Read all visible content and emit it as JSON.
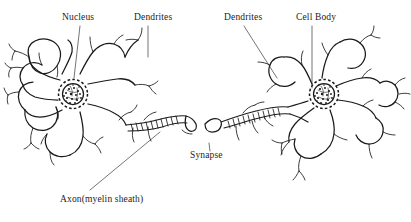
{
  "figure": {
    "background_color": "#ffffff",
    "ink_color": "#1a1a1a",
    "width": 411,
    "height": 222
  },
  "labels": {
    "nucleus": "Nucleus",
    "dendrites_left": "Dendrites",
    "dendrites_right": "Dendrites",
    "cell_body": "Cell Body",
    "synapse": "Synapse",
    "axon": "Axon(myelin sheath)"
  },
  "structures": [
    {
      "name": "left-neuron-soma",
      "label": "Cell body (left neuron)"
    },
    {
      "name": "left-neuron-nucleus",
      "label": "Nucleus"
    },
    {
      "name": "left-neuron-dendrites",
      "label": "Dendrites"
    },
    {
      "name": "left-neuron-axon",
      "label": "Axon with myelin sheath"
    },
    {
      "name": "synapse-gap",
      "label": "Synapse"
    },
    {
      "name": "right-neuron-axon",
      "label": "Axon with myelin sheath"
    },
    {
      "name": "right-neuron-soma",
      "label": "Cell body (right neuron)"
    },
    {
      "name": "right-neuron-nucleus",
      "label": "Nucleus"
    },
    {
      "name": "right-neuron-dendrites",
      "label": "Dendrites"
    }
  ],
  "leader_lines": [
    {
      "name": "leader-nucleus",
      "from": "Nucleus label",
      "to": "left neuron nucleus"
    },
    {
      "name": "leader-dendrites-left",
      "from": "Dendrites label",
      "to": "left neuron dendrite"
    },
    {
      "name": "leader-dendrites-right",
      "from": "Dendrites label",
      "to": "right neuron dendrite"
    },
    {
      "name": "leader-cell-body",
      "from": "Cell Body label",
      "to": "right neuron soma"
    },
    {
      "name": "leader-synapse",
      "from": "Synapse label",
      "to": "synaptic gap"
    },
    {
      "name": "leader-axon",
      "from": "Axon label",
      "to": "left neuron axon"
    }
  ]
}
